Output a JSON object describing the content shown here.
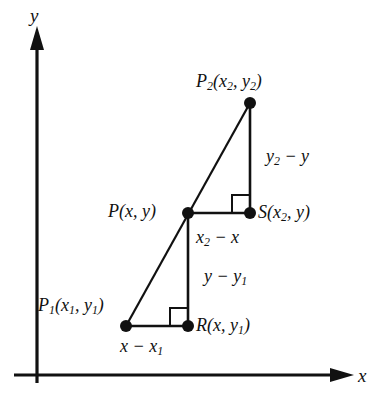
{
  "figure": {
    "background_color": "#ffffff",
    "ink_color": "#111111",
    "width": 376,
    "height": 413
  },
  "axes": {
    "x_label": "x",
    "y_label": "y",
    "origin": [
      37,
      375
    ],
    "x_axis_end": [
      352,
      375
    ],
    "y_axis_end": [
      37,
      28
    ]
  },
  "points": [
    {
      "id": "P2",
      "label_text": "P2(x2, y2)",
      "x": 250,
      "y": 103
    },
    {
      "id": "P",
      "label_text": "P(x, y)",
      "x": 188,
      "y": 213
    },
    {
      "id": "S",
      "label_text": "S(x2, y)",
      "x": 250,
      "y": 213
    },
    {
      "id": "P1",
      "label_text": "P1(x1, y1)",
      "x": 126,
      "y": 326
    },
    {
      "id": "R",
      "label_text": "R(x, y1)",
      "x": 188,
      "y": 326
    }
  ],
  "segment_labels": {
    "upper_vertical": "y2 - y",
    "upper_horizontal": "x2 - x",
    "lower_vertical": "y - y1",
    "lower_horizontal": "x - x1"
  },
  "parts": {
    "P": "P",
    "R": "R",
    "S": "S",
    "x": "x",
    "y": "y",
    "sub1": "1",
    "sub2": "2",
    "open_paren": "(",
    "close_paren": ")",
    "comma": ",",
    "minus": "−"
  }
}
